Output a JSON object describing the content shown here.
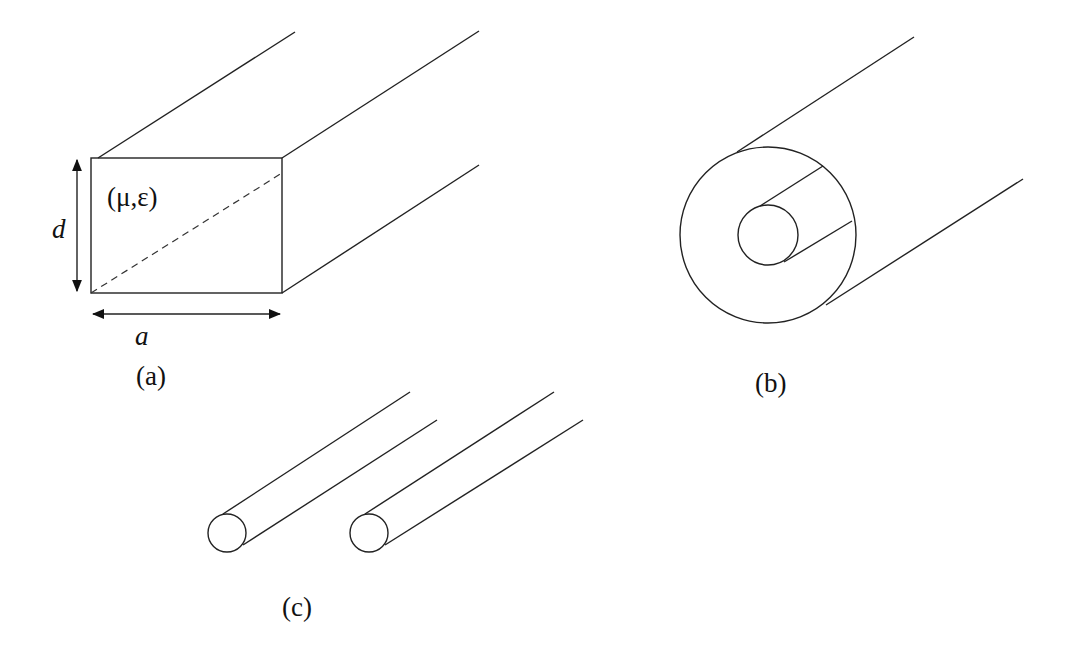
{
  "figure": {
    "panels": [
      {
        "id": "a",
        "caption": "(a)",
        "description": "rectangular waveguide",
        "material_label": "(μ,ε)",
        "height_label": "d",
        "width_label": "a"
      },
      {
        "id": "b",
        "caption": "(b)",
        "description": "coaxial line"
      },
      {
        "id": "c",
        "caption": "(c)",
        "description": "two-wire line"
      }
    ]
  },
  "colors": {
    "line": "#222222",
    "background": "#ffffff"
  }
}
